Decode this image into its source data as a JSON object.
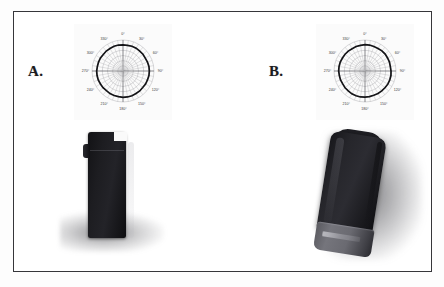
{
  "figure": {
    "panels": [
      {
        "letter": "A.",
        "view_name": "upright-front-view",
        "plot": {
          "title": "",
          "tick_labels": [
            "0°",
            "30°",
            "60°",
            "90°",
            "120°",
            "150°",
            "180°",
            "210°",
            "240°",
            "270°",
            "300°",
            "330°"
          ]
        },
        "device": {
          "orientation": "upright",
          "body_color": "#1a1a1e",
          "base_band_label": ""
        }
      },
      {
        "letter": "B.",
        "view_name": "tilted-angled-view",
        "plot": {
          "title": "",
          "tick_labels": [
            "0°",
            "30°",
            "60°",
            "90°",
            "120°",
            "150°",
            "180°",
            "210°",
            "240°",
            "270°",
            "300°",
            "330°"
          ]
        },
        "device": {
          "orientation": "tilted",
          "body_color": "#23232a",
          "base_band_label": ""
        }
      }
    ]
  },
  "chart_data": [
    {
      "type": "line",
      "subtype": "polar",
      "panel": "A",
      "title": "",
      "xlabel": "",
      "ylabel": "",
      "grid": true,
      "legend": "none",
      "angle_unit": "degrees",
      "tick_labels": [
        "0°",
        "30°",
        "60°",
        "90°",
        "120°",
        "150°",
        "180°",
        "210°",
        "240°",
        "270°",
        "300°",
        "330°"
      ],
      "angular_ticks": [
        0,
        30,
        60,
        90,
        120,
        150,
        180,
        210,
        240,
        270,
        300,
        330
      ],
      "grid_rings": 6,
      "radial_spoke_step_deg": 10,
      "rlim": [
        0,
        1
      ],
      "series": [
        {
          "name": "radiation-pattern",
          "theta": [
            0,
            10,
            20,
            30,
            40,
            50,
            60,
            70,
            80,
            90,
            100,
            110,
            120,
            130,
            140,
            150,
            160,
            170,
            180,
            190,
            200,
            210,
            220,
            230,
            240,
            250,
            260,
            270,
            280,
            290,
            300,
            310,
            320,
            330,
            340,
            350
          ],
          "values": [
            0.84,
            0.84,
            0.85,
            0.85,
            0.84,
            0.84,
            0.83,
            0.84,
            0.85,
            0.85,
            0.85,
            0.84,
            0.84,
            0.83,
            0.84,
            0.84,
            0.85,
            0.85,
            0.85,
            0.84,
            0.84,
            0.84,
            0.83,
            0.84,
            0.84,
            0.85,
            0.85,
            0.85,
            0.84,
            0.84,
            0.84,
            0.83,
            0.84,
            0.84,
            0.85,
            0.85
          ]
        }
      ]
    },
    {
      "type": "line",
      "subtype": "polar",
      "panel": "B",
      "title": "",
      "xlabel": "",
      "ylabel": "",
      "grid": true,
      "legend": "none",
      "angle_unit": "degrees",
      "tick_labels": [
        "0°",
        "30°",
        "60°",
        "90°",
        "120°",
        "150°",
        "180°",
        "210°",
        "240°",
        "270°",
        "300°",
        "330°"
      ],
      "angular_ticks": [
        0,
        30,
        60,
        90,
        120,
        150,
        180,
        210,
        240,
        270,
        300,
        330
      ],
      "grid_rings": 6,
      "radial_spoke_step_deg": 10,
      "rlim": [
        0,
        1
      ],
      "series": [
        {
          "name": "radiation-pattern",
          "theta": [
            0,
            10,
            20,
            30,
            40,
            50,
            60,
            70,
            80,
            90,
            100,
            110,
            120,
            130,
            140,
            150,
            160,
            170,
            180,
            190,
            200,
            210,
            220,
            230,
            240,
            250,
            260,
            270,
            280,
            290,
            300,
            310,
            320,
            330,
            340,
            350
          ],
          "values": [
            0.85,
            0.85,
            0.84,
            0.84,
            0.85,
            0.85,
            0.84,
            0.84,
            0.83,
            0.84,
            0.85,
            0.85,
            0.85,
            0.84,
            0.84,
            0.84,
            0.83,
            0.84,
            0.84,
            0.85,
            0.85,
            0.85,
            0.84,
            0.84,
            0.83,
            0.84,
            0.84,
            0.85,
            0.85,
            0.85,
            0.84,
            0.84,
            0.84,
            0.83,
            0.84,
            0.84
          ]
        }
      ]
    }
  ]
}
